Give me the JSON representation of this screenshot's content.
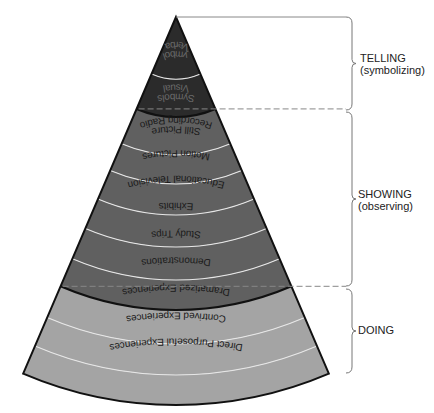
{
  "colors": {
    "telling_band": "#2b2b2b",
    "showing_band": "#606060",
    "doing_band": "#a4a4a4",
    "band_divider": "#e6e6e6",
    "group_divider": "#111111",
    "telling_text": "#6a6a6a",
    "showing_text": "#1a1a1a",
    "doing_text": "#1a1a1a"
  },
  "cone": {
    "apex": [
      176,
      17
    ],
    "half_angle_deg": 23.2,
    "bands": [
      {
        "label": [
          "Verbal",
          "Symbols"
        ],
        "group": "telling",
        "r_inner": 0,
        "r_outer": 62
      },
      {
        "label": [
          "Visual",
          "Symbols"
        ],
        "group": "telling",
        "r_inner": 62,
        "r_outer": 100
      },
      {
        "label": [
          "Recording Radio",
          "Still Picture"
        ],
        "group": "showing",
        "r_inner": 100,
        "r_outer": 138
      },
      {
        "label": [
          "Motion Pictures"
        ],
        "group": "showing",
        "r_inner": 138,
        "r_outer": 167
      },
      {
        "label": [
          "Educational Television"
        ],
        "group": "showing",
        "r_inner": 167,
        "r_outer": 198
      },
      {
        "label": [
          "Exhibits"
        ],
        "group": "showing",
        "r_inner": 198,
        "r_outer": 230
      },
      {
        "label": [
          "Study Trips"
        ],
        "group": "showing",
        "r_inner": 230,
        "r_outer": 263
      },
      {
        "label": [
          "Demonstrations"
        ],
        "group": "showing",
        "r_inner": 263,
        "r_outer": 293
      },
      {
        "label": [
          "Dramatized Experiences"
        ],
        "group": "doing",
        "r_inner": 293,
        "r_outer": 327
      },
      {
        "label": [
          "Contrived Experiences"
        ],
        "group": "doing",
        "r_inner": 327,
        "r_outer": 358
      },
      {
        "label": [
          "Direct Purposeful Experiences"
        ],
        "group": "doing",
        "r_inner": 358,
        "r_outer": 388
      }
    ]
  },
  "groups": [
    {
      "id": "telling",
      "line1": "TELLING",
      "line2": "(symbolizing)",
      "y_top": 17,
      "y_bottom": 110
    },
    {
      "id": "showing",
      "line1": "SHOWING",
      "line2": "(observing)",
      "y_top": 112,
      "y_bottom": 286
    },
    {
      "id": "doing",
      "line1": "DOING",
      "line2": "",
      "y_top": 289,
      "y_bottom": 373
    }
  ]
}
